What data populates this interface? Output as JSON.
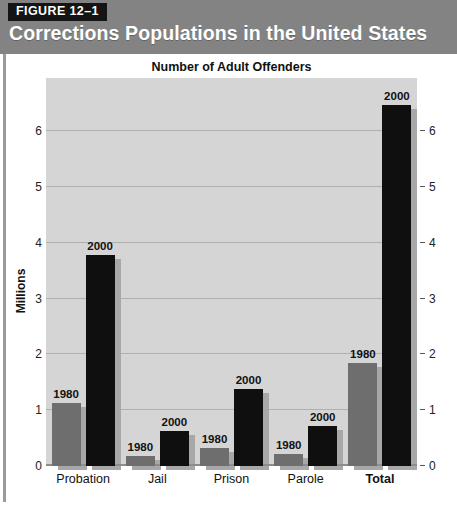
{
  "header": {
    "figure_tag": "FIGURE 12–1",
    "title": "Corrections Populations in the United States"
  },
  "chart_data": {
    "type": "bar",
    "title": "Number of Adult Offenders",
    "xlabel": "",
    "ylabel": "Millions",
    "ylim": [
      0,
      6.95
    ],
    "grid": true,
    "legend": "none",
    "axis_left_ticks": [
      "0",
      "1",
      "2",
      "3",
      "4",
      "5",
      "6"
    ],
    "axis_right_ticks": [
      "0",
      "1",
      "2",
      "3",
      "4",
      "5",
      "6"
    ],
    "categories": [
      "Probation",
      "Jail",
      "Prison",
      "Parole",
      "Total"
    ],
    "series": [
      {
        "name": "1980",
        "values": [
          1.12,
          0.18,
          0.32,
          0.22,
          1.84
        ]
      },
      {
        "name": "2000",
        "values": [
          3.78,
          0.62,
          1.38,
          0.72,
          6.47
        ]
      }
    ],
    "bar_labels": [
      [
        "1980",
        "2000"
      ],
      [
        "1980",
        "2000"
      ],
      [
        "1980",
        "2000"
      ],
      [
        "1980",
        "2000"
      ],
      [
        "1980",
        "2000"
      ]
    ],
    "colors": {
      "series_1980": "#6e6e6e",
      "series_2000": "#100f0f",
      "plot_background": "#d5d5d5",
      "gridline": "#b0b0b0",
      "header_background": "#838383",
      "figure_tag_background": "#141414"
    },
    "bold_categories": [
      "Total"
    ]
  }
}
